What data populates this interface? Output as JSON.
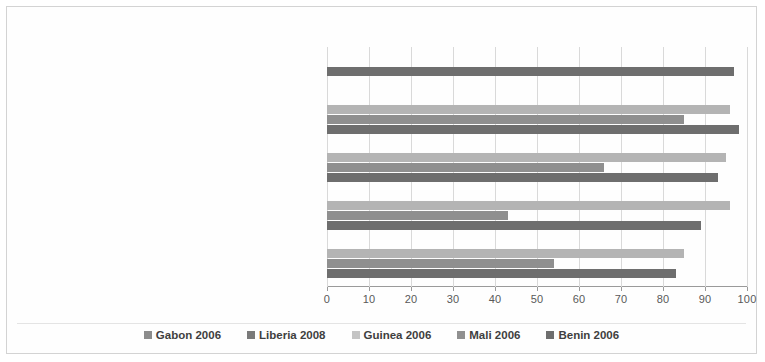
{
  "chart_data": {
    "type": "bar",
    "orientation": "horizontal",
    "title": "",
    "xlabel": "",
    "ylabel": "",
    "xlim": [
      0,
      100
    ],
    "xticks": [
      0,
      10,
      20,
      30,
      40,
      50,
      60,
      70,
      80,
      90,
      100
    ],
    "grid": true,
    "legend_position": "bottom",
    "categories": [
      "A good meal on holidays (Sunday, ceremony, etc.)",
      "Eat three meals a day every day",
      "Eating meat or fish every day",
      "Eat cereals or tubers daily",
      "Eat vegetables every day"
    ],
    "series": [
      {
        "name": "Gabon 2006",
        "color": "#8c8c8c",
        "values": [
          null,
          null,
          null,
          null,
          null
        ]
      },
      {
        "name": "Liberia 2008",
        "color": "#7a7a7a",
        "values": [
          null,
          null,
          null,
          null,
          null
        ]
      },
      {
        "name": "Guinea 2006",
        "color": "#b4b4b4",
        "values": [
          null,
          96,
          95,
          96,
          85
        ]
      },
      {
        "name": "Mali 2006",
        "color": "#8f8f8f",
        "values": [
          null,
          85,
          66,
          43,
          54
        ]
      },
      {
        "name": "Benin 2006",
        "color": "#6e6e6e",
        "values": [
          97,
          98,
          93,
          89,
          83
        ]
      }
    ]
  },
  "legend": {
    "items": [
      {
        "label": "Gabon 2006",
        "color": "#8c8c8c"
      },
      {
        "label": "Liberia 2008",
        "color": "#7a7a7a"
      },
      {
        "label": "Guinea 2006",
        "color": "#c4c4c4"
      },
      {
        "label": "Mali 2006",
        "color": "#909090"
      },
      {
        "label": "Benin 2006",
        "color": "#6e6e6e"
      }
    ]
  },
  "axis": {
    "tick_labels": [
      "0",
      "10",
      "20",
      "30",
      "40",
      "50",
      "60",
      "70",
      "80",
      "90",
      "100"
    ]
  }
}
